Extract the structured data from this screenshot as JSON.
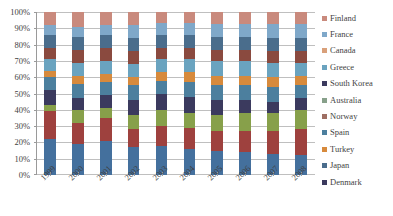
{
  "chart_data": {
    "type": "bar",
    "subtype": "100% stacked column",
    "title": "",
    "xlabel": "",
    "ylabel": "",
    "ylim": [
      0,
      100
    ],
    "ytick_labels": [
      "0%",
      "10%",
      "20%",
      "30%",
      "40%",
      "50%",
      "60%",
      "70%",
      "80%",
      "90%",
      "100%"
    ],
    "ytick_values": [
      0,
      10,
      20,
      30,
      40,
      50,
      60,
      70,
      80,
      90,
      100
    ],
    "grid": true,
    "grid_axis": "y",
    "legend_position": "right",
    "categories": [
      "1999",
      "2000",
      "2001",
      "2002",
      "2003",
      "2004",
      "2005",
      "2006",
      "2007",
      "2008"
    ],
    "series": [
      {
        "name": "Denmark",
        "color": "#44709d",
        "values": [
          22,
          19,
          21,
          17,
          18,
          16,
          15,
          14,
          13,
          12
        ]
      },
      {
        "name": "Japan",
        "color": "#9e413e",
        "values": [
          17,
          13,
          14,
          11,
          12,
          13,
          12,
          13,
          14,
          16
        ]
      },
      {
        "name": "Turkey",
        "color": "#87a04a",
        "values": [
          4,
          8,
          6,
          9,
          10,
          9,
          10,
          11,
          11,
          12
        ]
      },
      {
        "name": "Spain",
        "color": "#3b3a5e",
        "values": [
          9,
          7,
          8,
          9,
          10,
          10,
          9,
          8,
          7,
          7
        ]
      },
      {
        "name": "Norway",
        "color": "#4c7f9e",
        "values": [
          8,
          9,
          8,
          9,
          8,
          9,
          9,
          9,
          9,
          8
        ]
      },
      {
        "name": "Australia",
        "color": "#d78a3c",
        "values": [
          4,
          5,
          5,
          5,
          5,
          6,
          6,
          6,
          6,
          6
        ]
      },
      {
        "name": "South Korea",
        "color": "#6aa3bf",
        "values": [
          7,
          8,
          8,
          8,
          8,
          8,
          9,
          9,
          9,
          8
        ]
      },
      {
        "name": "Greece",
        "color": "#8a4a3f",
        "values": [
          7,
          8,
          8,
          8,
          7,
          7,
          7,
          7,
          7,
          7
        ]
      },
      {
        "name": "Canada",
        "color": "#4a6d8c",
        "values": [
          8,
          8,
          8,
          8,
          8,
          8,
          8,
          8,
          8,
          8
        ]
      },
      {
        "name": "France",
        "color": "#7fa8c9",
        "values": [
          6,
          6,
          6,
          8,
          7,
          7,
          8,
          8,
          9,
          9
        ]
      },
      {
        "name": "Finland",
        "color": "#c98a7d",
        "values": [
          8,
          9,
          8,
          8,
          7,
          7,
          7,
          7,
          7,
          7
        ]
      }
    ]
  },
  "legend": {
    "items": [
      {
        "label": "Finland",
        "color": "#c98a7d"
      },
      {
        "label": "France",
        "color": "#7fa8c9"
      },
      {
        "label": "Canada",
        "color": "#d9a07a"
      },
      {
        "label": "Greece",
        "color": "#6aa3bf"
      },
      {
        "label": "South Korea",
        "color": "#3b3a5e"
      },
      {
        "label": "Australia",
        "color": "#87a08a"
      },
      {
        "label": "Norway",
        "color": "#9e6f63"
      },
      {
        "label": "Spain",
        "color": "#4c7f9e"
      },
      {
        "label": "Turkey",
        "color": "#d78a3c"
      },
      {
        "label": "Japan",
        "color": "#4a6d8c"
      },
      {
        "label": "Denmark",
        "color": "#3b3a5e"
      }
    ]
  },
  "axes": {
    "y_labels": [
      "100%",
      "90%",
      "80%",
      "70%",
      "60%",
      "50%",
      "40%",
      "30%",
      "20%",
      "10%",
      "0%"
    ],
    "x_labels": [
      "1999",
      "2000",
      "2001",
      "2002",
      "2003",
      "2004",
      "2005",
      "2006",
      "2007",
      "2008"
    ]
  },
  "style": {
    "plot_background": "#ffffff",
    "gridline_color": "#bfbfbf",
    "axis_color": "#9a9a9a",
    "text_color": "#3f3f3f"
  }
}
